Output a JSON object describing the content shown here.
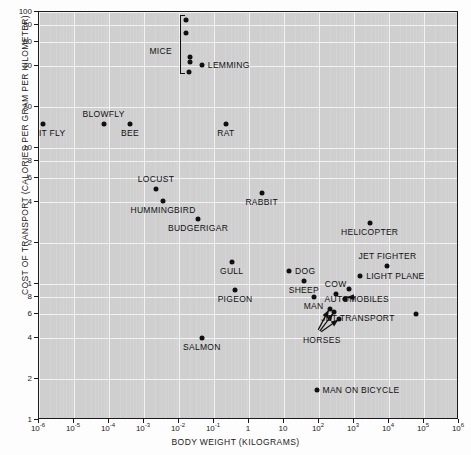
{
  "chart_data": {
    "type": "scatter",
    "title": "",
    "xlabel": "BODY WEIGHT (KILOGRAMS)",
    "ylabel": "COST OF TRANSPORT (CALORIES PER GRAM PER KILOMETER)",
    "xscale": "log",
    "yscale": "log",
    "xlim": [
      1e-06,
      1000000.0
    ],
    "ylim": [
      0.1,
      100
    ],
    "grid": true,
    "legend": "none",
    "xticks": [
      {
        "value": 1e-06,
        "label": "10",
        "exp": "-6"
      },
      {
        "value": 1e-05,
        "label": "10",
        "exp": "-5"
      },
      {
        "value": 0.0001,
        "label": "10",
        "exp": "-4"
      },
      {
        "value": 0.001,
        "label": "10",
        "exp": "-3"
      },
      {
        "value": 0.01,
        "label": "10",
        "exp": "-2"
      },
      {
        "value": 0.1,
        "label": "10",
        "exp": "-1"
      },
      {
        "value": 1,
        "label": "1",
        "exp": ""
      },
      {
        "value": 10,
        "label": "10",
        "exp": ""
      },
      {
        "value": 100,
        "label": "10",
        "exp": "2"
      },
      {
        "value": 1000,
        "label": "10",
        "exp": "3"
      },
      {
        "value": 10000,
        "label": "10",
        "exp": "4"
      },
      {
        "value": 100000,
        "label": "10",
        "exp": "5"
      },
      {
        "value": 1000000,
        "label": "10",
        "exp": "6"
      }
    ],
    "yticks": [
      {
        "value": 100,
        "label": "100"
      },
      {
        "value": 80,
        "label": "80"
      },
      {
        "value": 60,
        "label": "60"
      },
      {
        "value": 40,
        "label": "40"
      },
      {
        "value": 20,
        "label": "20"
      },
      {
        "value": 10,
        "label": "10"
      },
      {
        "value": 8,
        "label": "8"
      },
      {
        "value": 6,
        "label": "6"
      },
      {
        "value": 4,
        "label": "4"
      },
      {
        "value": 2,
        "label": "2"
      },
      {
        "value": 1,
        "label": "1"
      },
      {
        "value": 0.8,
        "label": "8"
      },
      {
        "value": 0.6,
        "label": "6"
      },
      {
        "value": 0.4,
        "label": "4"
      },
      {
        "value": 0.2,
        "label": "2"
      },
      {
        "value": 0.1,
        "label": "1"
      }
    ],
    "points": [
      {
        "name": "FRUIT FLY",
        "x": 1.3e-06,
        "y": 15.0,
        "label": "FRUIT FLY",
        "label_pos": "below-center"
      },
      {
        "name": "BLOWFLY",
        "x": 7e-05,
        "y": 15.0,
        "label": "BLOWFLY",
        "label_pos": "above-center"
      },
      {
        "name": "BEE",
        "x": 0.0004,
        "y": 15.0,
        "label": "BEE",
        "label_pos": "below-center"
      },
      {
        "name": "LOCUST",
        "x": 0.0022,
        "y": 5.0,
        "label": "LOCUST",
        "label_pos": "above-center"
      },
      {
        "name": "HUMMINGBIRD",
        "x": 0.0035,
        "y": 4.1,
        "label": "HUMMINGBIRD",
        "label_pos": "below-center"
      },
      {
        "name": "MOUSE 1",
        "x": 0.016,
        "y": 88.0,
        "label": "",
        "label_pos": ""
      },
      {
        "name": "MOUSE 2",
        "x": 0.016,
        "y": 70.0,
        "label": "",
        "label_pos": ""
      },
      {
        "name": "MOUSE 3",
        "x": 0.02,
        "y": 47.0,
        "label": "",
        "label_pos": ""
      },
      {
        "name": "MOUSE 4",
        "x": 0.02,
        "y": 43.0,
        "label": "",
        "label_pos": ""
      },
      {
        "name": "MOUSE 5",
        "x": 0.019,
        "y": 36.0,
        "label": "",
        "label_pos": ""
      },
      {
        "name": "LEMMING",
        "x": 0.045,
        "y": 41.0,
        "label": "LEMMING",
        "label_pos": "right"
      },
      {
        "name": "BUDGERIGAR",
        "x": 0.035,
        "y": 3.0,
        "label": "BUDGERIGAR",
        "label_pos": "below-center"
      },
      {
        "name": "SALMON",
        "x": 0.045,
        "y": 0.4,
        "label": "SALMON",
        "label_pos": "below-center"
      },
      {
        "name": "GULL",
        "x": 0.32,
        "y": 1.45,
        "label": "GULL",
        "label_pos": "below-center"
      },
      {
        "name": "PIGEON",
        "x": 0.4,
        "y": 0.9,
        "label": "PIGEON",
        "label_pos": "below-center"
      },
      {
        "name": "RAT",
        "x": 0.22,
        "y": 15.0,
        "label": "RAT",
        "label_pos": "below-center"
      },
      {
        "name": "RABBIT",
        "x": 2.3,
        "y": 4.7,
        "label": "RABBIT",
        "label_pos": "below-center"
      },
      {
        "name": "DOG",
        "x": 14.0,
        "y": 1.25,
        "label": "DOG",
        "label_pos": "right"
      },
      {
        "name": "SHEEP",
        "x": 37.0,
        "y": 1.05,
        "label": "SHEEP",
        "label_pos": "below-center"
      },
      {
        "name": "MAN",
        "x": 70.0,
        "y": 0.8,
        "label": "MAN",
        "label_pos": "below-center"
      },
      {
        "name": "COW",
        "x": 300.0,
        "y": 0.85,
        "label": "COW",
        "label_pos": "above-center"
      },
      {
        "name": "HORSE 1",
        "x": 200.0,
        "y": 0.66,
        "label": "",
        "label_pos": ""
      },
      {
        "name": "HORSE 2",
        "x": 260.0,
        "y": 0.62,
        "label": "",
        "label_pos": ""
      },
      {
        "name": "HORSE 3",
        "x": 370.0,
        "y": 0.55,
        "label": "",
        "label_pos": ""
      },
      {
        "name": "AUTOMOBILE 1",
        "x": 700.0,
        "y": 0.92,
        "label": "",
        "label_pos": ""
      },
      {
        "name": "AUTOMOBILE 2",
        "x": 560.0,
        "y": 0.78,
        "label": "",
        "label_pos": ""
      },
      {
        "name": "HELICOPTER",
        "x": 2800.0,
        "y": 2.8,
        "label": "HELICOPTER",
        "label_pos": "below-center"
      },
      {
        "name": "JET FIGHTER",
        "x": 9000.0,
        "y": 1.35,
        "label": "JET FIGHTER",
        "label_pos": "above-center"
      },
      {
        "name": "LIGHT PLANE",
        "x": 1500.0,
        "y": 1.15,
        "label": "LIGHT PLANE",
        "label_pos": "right"
      },
      {
        "name": "JET TRANSPORT",
        "x": 60000.0,
        "y": 0.6,
        "label": "",
        "label_pos": ""
      },
      {
        "name": "MAN ON BICYCLE",
        "x": 85.0,
        "y": 0.165,
        "label": "MAN ON BICYCLE",
        "label_pos": "right"
      }
    ],
    "group_labels": [
      {
        "name": "MICE",
        "text": "MICE",
        "x": 0.003,
        "y": 52.0
      },
      {
        "name": "HORSES",
        "text": "HORSES",
        "x": 120.0,
        "y": 0.39
      },
      {
        "name": "AUTOMOBILES",
        "text": "AUTOMOBILES",
        "x": 1200.0,
        "y": 0.78
      },
      {
        "name": "JET TRANSPORT",
        "text": "JET TRANSPORT",
        "x": 1300.0,
        "y": 0.56
      }
    ],
    "brackets": [
      {
        "name": "mice-bracket",
        "x": 0.0105,
        "y_top": 95.0,
        "y_bottom": 35.0
      }
    ],
    "arrows": [
      {
        "name": "horses-arrow-1",
        "from_x": 95.0,
        "from_y": 0.46,
        "to_x": 190.0,
        "to_y": 0.645
      },
      {
        "name": "horses-arrow-2",
        "from_x": 105.0,
        "from_y": 0.45,
        "to_x": 250.0,
        "to_y": 0.605
      },
      {
        "name": "horses-arrow-3",
        "from_x": 115.0,
        "from_y": 0.445,
        "to_x": 355.0,
        "to_y": 0.545
      },
      {
        "name": "automobiles-arrow",
        "from_x": 1050.0,
        "from_y": 0.8,
        "to_x": 620.0,
        "to_y": 0.8
      }
    ]
  }
}
